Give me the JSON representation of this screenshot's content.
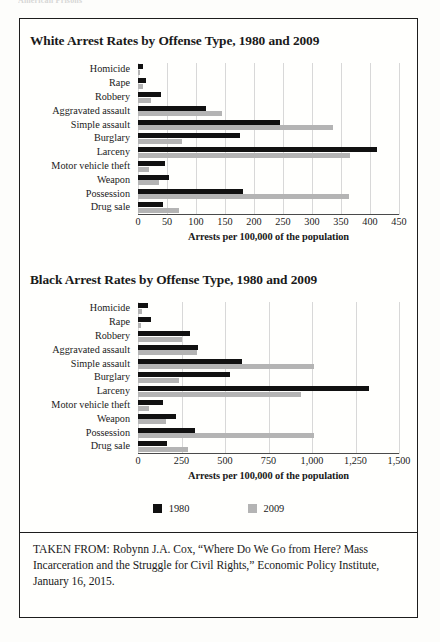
{
  "running_head": "American Prisons",
  "legend": {
    "items": [
      {
        "label": "1980",
        "color": "#111111",
        "name": "legend-1980"
      },
      {
        "label": "2009",
        "color": "#b4b4b4",
        "name": "legend-2009"
      }
    ]
  },
  "source": {
    "text": "TAKEN FROM: Robynn J.A. Cox, “Where Do We Go from Here? Mass Incarceration and the Struggle for Civil Rights,” Economic Policy Institute, January 16, 2015."
  },
  "chart_data": [
    {
      "type": "bar",
      "orientation": "horizontal",
      "title": "White Arrest Rates by Offense Type, 1980 and 2009",
      "xlabel": "Arrests per 100,000 of the population",
      "ylabel": "",
      "xlim": [
        0,
        450
      ],
      "xticks": [
        0,
        50,
        100,
        150,
        200,
        250,
        300,
        350,
        400,
        450
      ],
      "xtick_labels": [
        "0",
        "50",
        "100",
        "150",
        "200",
        "250",
        "300",
        "350",
        "400",
        "450"
      ],
      "grid": true,
      "legend_position": "bottom-shared",
      "categories": [
        "Homicide",
        "Rape",
        "Robbery",
        "Aggravated assault",
        "Simple assault",
        "Burglary",
        "Larceny",
        "Motor vehicle theft",
        "Weapon",
        "Possession",
        "Drug sale"
      ],
      "series": [
        {
          "name": "1980",
          "color": "#111111",
          "values": [
            8,
            14,
            40,
            118,
            245,
            175,
            412,
            47,
            53,
            181,
            43
          ]
        },
        {
          "name": "2009",
          "color": "#b4b4b4",
          "values": [
            3,
            8,
            22,
            144,
            336,
            75,
            365,
            19,
            37,
            364,
            70
          ]
        }
      ]
    },
    {
      "type": "bar",
      "orientation": "horizontal",
      "title": "Black Arrest Rates by Offense Type, 1980 and 2009",
      "xlabel": "Arrests per 100,000 of the population",
      "ylabel": "",
      "xlim": [
        0,
        1500
      ],
      "xticks": [
        0,
        250,
        500,
        750,
        1000,
        1250,
        1500
      ],
      "xtick_labels": [
        "0",
        "250",
        "500",
        "750",
        "1,000",
        "1,250",
        "1,500"
      ],
      "grid": true,
      "legend_position": "bottom-shared",
      "categories": [
        "Homicide",
        "Rape",
        "Robbery",
        "Aggravated assault",
        "Simple assault",
        "Burglary",
        "Larceny",
        "Motor vehicle theft",
        "Weapon",
        "Possession",
        "Drug sale"
      ],
      "series": [
        {
          "name": "1980",
          "color": "#111111",
          "values": [
            55,
            75,
            300,
            345,
            600,
            530,
            1330,
            145,
            220,
            330,
            165
          ]
        },
        {
          "name": "2009",
          "color": "#b4b4b4",
          "values": [
            25,
            20,
            250,
            340,
            1010,
            235,
            935,
            65,
            160,
            1010,
            290
          ]
        }
      ]
    }
  ]
}
